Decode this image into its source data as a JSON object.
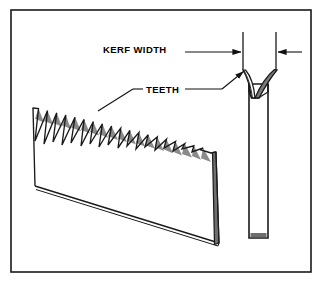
{
  "figure": {
    "background_color": "#ffffff",
    "border": {
      "name": "figure-border",
      "color": "#1a1a1a",
      "x": 11,
      "y": 10,
      "width": 300,
      "height": 262,
      "stroke_width": 1.6
    }
  },
  "labels": {
    "kerf_width": "KERF WIDTH",
    "teeth": "TEETH"
  },
  "colors": {
    "outline": "#1a1a1a",
    "tooth_shade": "#8a8a8a",
    "blade_edge_shade": "#6f6f6f",
    "kerf_wedge_fill": "#7a7a7a",
    "blade_face": "#ffffff",
    "leader": "#111111"
  },
  "annotations": {
    "kerf_dimension": {
      "name": "kerf-width-dimension",
      "left_extension_x": 243,
      "right_extension_x": 276,
      "extension_top_y": 32,
      "extension_bottom_y": 70,
      "arrow_y": 52,
      "left_arrow_tail_x": 185,
      "right_arrow_tail_x": 302
    },
    "teeth_leader_left": {
      "name": "teeth-leader-left",
      "from_x": 143,
      "from_y": 89,
      "to_x": 97,
      "to_y": 112
    },
    "teeth_leader_right": {
      "name": "teeth-leader-right",
      "from_x": 185,
      "from_y": 89,
      "to_x": 245,
      "to_y": 70
    }
  },
  "blade_perspective": {
    "name": "saw-blade-perspective-view",
    "tooth_count": 19,
    "top_left": {
      "x": 33,
      "y": 108
    },
    "top_right": {
      "x": 216,
      "y": 152
    },
    "bottom_left": {
      "x": 35,
      "y": 186
    },
    "bottom_right": {
      "x": 219,
      "y": 243
    },
    "thickness_px": 6
  },
  "blade_edge_view": {
    "name": "saw-blade-edge-view",
    "left_x": 249,
    "right_x": 268,
    "top_y": 70,
    "bottom_y": 238,
    "kerf_left_tip_x": 243,
    "kerf_right_tip_x": 277,
    "kerf_tip_y": 70,
    "kerf_valley_y": 98
  }
}
